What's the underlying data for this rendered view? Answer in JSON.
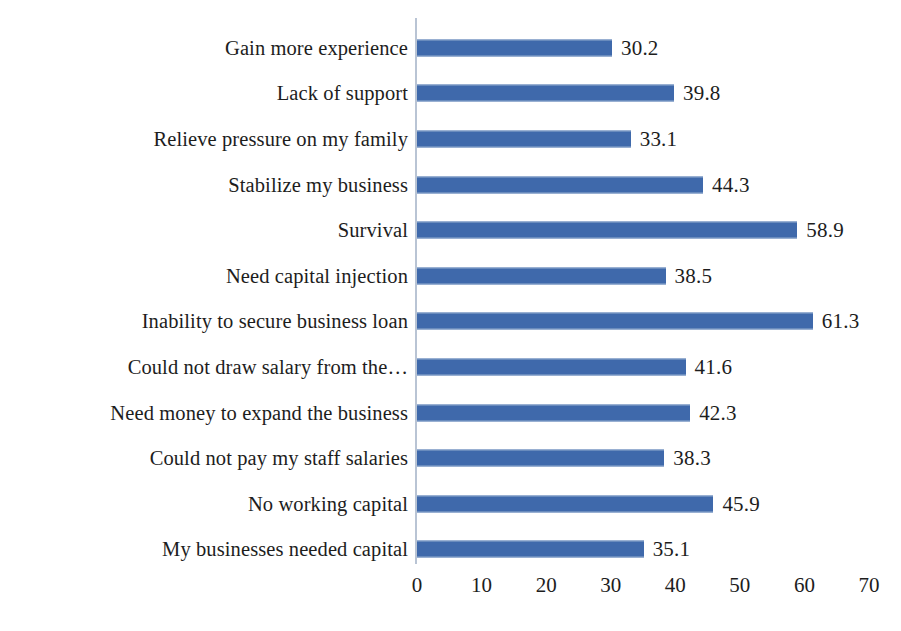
{
  "chart_data": {
    "type": "bar",
    "orientation": "horizontal",
    "title": "",
    "subtitle": "",
    "xlabel": "",
    "ylabel": "",
    "xlim": [
      0,
      70
    ],
    "xticks": [
      "0",
      "10",
      "20",
      "30",
      "40",
      "50",
      "60",
      "70"
    ],
    "grid": false,
    "legend": null,
    "data_labels": true,
    "series_color": "#3f69ab",
    "categories": [
      "Gain more experience",
      "Lack of support",
      "Relieve pressure on my family",
      "Stabilize my business",
      "Survival",
      "Need capital injection",
      "Inability to secure business loan",
      "Could not draw salary from the…",
      "Need money to expand the business",
      "Could not pay my staff salaries",
      "No working capital",
      "My businesses needed capital"
    ],
    "values": [
      30.2,
      39.8,
      33.1,
      44.3,
      58.9,
      38.5,
      61.3,
      41.6,
      42.3,
      38.3,
      45.9,
      35.1
    ],
    "value_labels": [
      "30.2",
      "39.8",
      "33.1",
      "44.3",
      "58.9",
      "38.5",
      "61.3",
      "41.6",
      "42.3",
      "38.3",
      "45.9",
      "35.1"
    ]
  }
}
